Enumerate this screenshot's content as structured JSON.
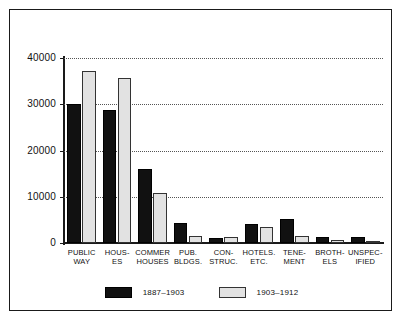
{
  "chart_data": {
    "type": "bar",
    "title": "",
    "subtitle": "",
    "xlabel": "",
    "ylabel": "",
    "ylim": [
      0,
      40000
    ],
    "ytick_labels": [
      "0",
      "10000",
      "20000",
      "30000",
      "40000"
    ],
    "ytick_values": [
      0,
      10000,
      20000,
      30000,
      40000
    ],
    "grid": "horizontal-dotted",
    "legend_position": "bottom-center",
    "categories": [
      "PUBLIC\nWAY",
      "HOUS-\nES",
      "COMMER\nHOUSES",
      "PUB.\nBLDGS.",
      "CON-\nSTRUC.",
      "HOTELS.\nETC.",
      "TENE-\nMENT",
      "BROTH-\nELS",
      "UNSPEC-\nIFIED"
    ],
    "series": [
      {
        "name": "1887–1903",
        "color": "#111111",
        "values": [
          30100,
          28700,
          15900,
          4300,
          1100,
          4100,
          5300,
          1400,
          1400
        ]
      },
      {
        "name": "1903–1912",
        "color": "#e2e2e2",
        "values": [
          37100,
          35600,
          10900,
          1500,
          1300,
          3500,
          1500,
          700,
          400
        ]
      }
    ]
  },
  "legend": {
    "entries": [
      {
        "label": "1887–1903",
        "swatch": "dark"
      },
      {
        "label": "1903–1912",
        "swatch": "light"
      }
    ]
  }
}
